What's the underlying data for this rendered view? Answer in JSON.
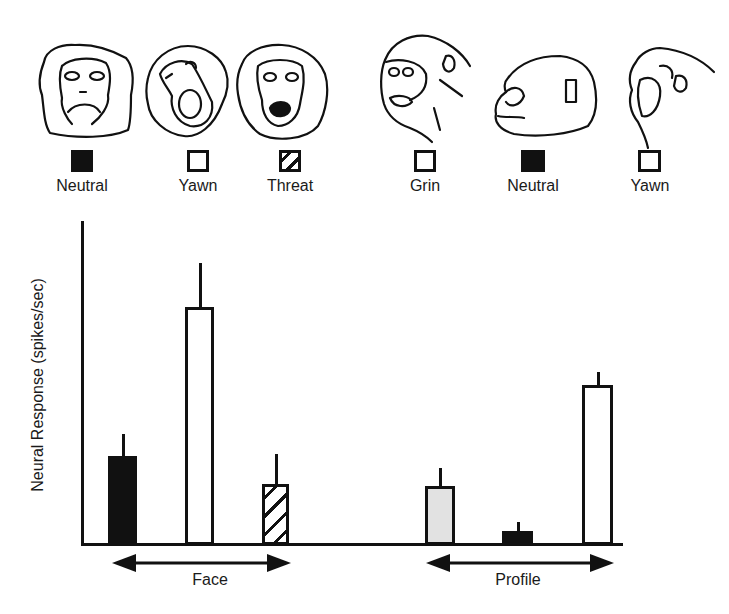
{
  "figure": {
    "ylabel": "Neural Response (spikes/sec)",
    "groups": [
      {
        "label": "Face"
      },
      {
        "label": "Profile"
      }
    ],
    "legend": [
      {
        "label": "Neutral",
        "fill": "solid",
        "group": "Face",
        "drawing": "frontal face, neutral expression"
      },
      {
        "label": "Yawn",
        "fill": "open",
        "group": "Face",
        "drawing": "frontal face, yawn"
      },
      {
        "label": "Threat",
        "fill": "hatch",
        "group": "Face",
        "drawing": "frontal face, open-mouth threat"
      },
      {
        "label": "Grin",
        "fill": "stipple",
        "group": "Profile",
        "drawing": "three-quarter profile, grin"
      },
      {
        "label": "Neutral",
        "fill": "solid",
        "group": "Profile",
        "drawing": "profile, neutral expression"
      },
      {
        "label": "Yawn",
        "fill": "open",
        "group": "Profile",
        "drawing": "profile, yawn"
      }
    ],
    "colors": {
      "ink": "#111111",
      "stipple": "#e2e2e2",
      "background": "#ffffff"
    }
  },
  "chart_data": {
    "type": "bar",
    "title": "",
    "xlabel": "",
    "ylabel": "Neural Response (spikes/sec)",
    "y_units_note": "No y-axis ticks shown; values are relative bar heights (px above baseline, axis height ~322)",
    "ylim": [
      0,
      322
    ],
    "grid": false,
    "legend_position": "top (drawings with swatches above plot)",
    "group_labels": [
      "Face",
      "Profile"
    ],
    "categories": [
      "Face Neutral",
      "Face Yawn",
      "Face Threat",
      "Profile Grin",
      "Profile Neutral",
      "Profile Yawn"
    ],
    "series": [
      {
        "name": "Mean response",
        "values": [
          89,
          238,
          61,
          59,
          14,
          160
        ],
        "error_upper": [
          22,
          44,
          30,
          18,
          9,
          13
        ],
        "fills": [
          "solid",
          "open",
          "hatch",
          "stipple",
          "solid",
          "open"
        ]
      }
    ]
  }
}
